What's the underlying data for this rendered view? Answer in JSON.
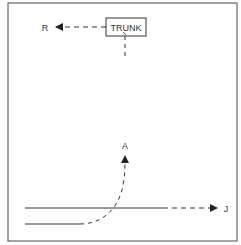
{
  "diagram": {
    "box_label": "TRUNK",
    "labels": {
      "r": "R",
      "a": "A",
      "j": "J"
    },
    "colors": {
      "line": "#333333",
      "frame": "#666666",
      "background": "#ffffff"
    }
  }
}
